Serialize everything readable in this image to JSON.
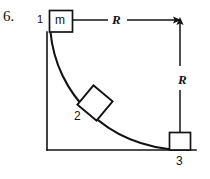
{
  "diagram": {
    "problem_number": "6.",
    "positions": [
      {
        "id": "1",
        "label": "1",
        "mass_label": "m"
      },
      {
        "id": "2",
        "label": "2"
      },
      {
        "id": "3",
        "label": "3"
      }
    ],
    "mass_label": "m",
    "dimensions": {
      "horizontal_radius_label": "R",
      "vertical_radius_label": "R"
    },
    "colors": {
      "ink": "#131313",
      "background": "#ffffff"
    },
    "geometry": {
      "axis_origin_x": 47,
      "axis_origin_y": 150,
      "axis_top_y": 32,
      "baseline_right_x": 196,
      "arc_start": [
        50,
        32
      ],
      "arc_end": [
        180,
        150
      ],
      "arrow_horizontal_start_x": 73,
      "arrow_horizontal_end_x": 180,
      "arrow_horizontal_y": 20,
      "arrow_vertical_x": 180,
      "arrow_vertical_top_y": 20,
      "arrow_vertical_bottom_y": 150
    }
  }
}
